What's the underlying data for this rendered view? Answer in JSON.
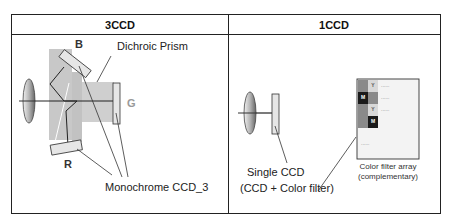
{
  "table": {
    "columns": [
      {
        "id": "3ccd",
        "header": "3CCD"
      },
      {
        "id": "1ccd",
        "header": "1CCD"
      }
    ]
  },
  "three_ccd": {
    "labels": {
      "blue": "B",
      "green": "G",
      "red": "R",
      "prism": "Dichroic Prism",
      "sensor": "Monochrome CCD_3"
    }
  },
  "one_ccd": {
    "labels": {
      "sensor_line1": "Single CCD",
      "sensor_line2": "(CCD + Color filter)",
      "filter_line1": "Color filter array",
      "filter_line2": "(complementary)"
    },
    "filter_cells": [
      {
        "row": 0,
        "col": 0,
        "label": "",
        "color": "#8a8a8a"
      },
      {
        "row": 0,
        "col": 1,
        "label": "Y",
        "color": "#d8d8d8"
      },
      {
        "row": 1,
        "col": 0,
        "label": "M",
        "color": "#1a1a1a"
      },
      {
        "row": 1,
        "col": 1,
        "label": "",
        "color": "#8a8a8a"
      },
      {
        "row": 2,
        "col": 0,
        "label": "",
        "color": "#8a8a8a"
      },
      {
        "row": 2,
        "col": 1,
        "label": "Y",
        "color": "#d8d8d8"
      },
      {
        "row": 3,
        "col": 0,
        "label": "",
        "color": "#8a8a8a"
      },
      {
        "row": 3,
        "col": 1,
        "label": "M",
        "color": "#1a1a1a"
      }
    ],
    "ellipsis": "......"
  },
  "colors": {
    "border": "#222222",
    "prism_fill": "#c8c8c8",
    "sensor_fill": "#e6e6e6",
    "g_label": "#999999"
  }
}
